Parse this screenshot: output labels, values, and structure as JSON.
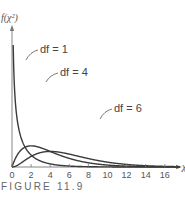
{
  "chart_data": {
    "type": "line",
    "title": "",
    "caption": "FIGURE 11.9",
    "xlabel": "χ²",
    "ylabel": "f(χ²)",
    "xlim": [
      0,
      17.5
    ],
    "ylim": [
      0,
      0.7
    ],
    "x_ticks": [
      0,
      2,
      4,
      6,
      8,
      10,
      12,
      14,
      16
    ],
    "x_tick_labels": [
      "0",
      "2",
      "4",
      "6",
      "8",
      "10",
      "12",
      "14",
      "16"
    ],
    "grid": false,
    "series": [
      {
        "name": "df = 1",
        "df": 1,
        "label": "df = 1"
      },
      {
        "name": "df = 4",
        "df": 4,
        "label": "df = 4"
      },
      {
        "name": "df = 6",
        "df": 6,
        "label": "df = 6"
      }
    ],
    "curve_color": "#3a3a3a",
    "axis_color": "#777777"
  }
}
